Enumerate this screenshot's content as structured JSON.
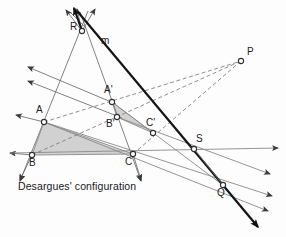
{
  "figure": {
    "title_caption": "Desargues' configuration",
    "caption_position": {
      "x": 18,
      "y": 186
    },
    "width": 286,
    "height": 237,
    "background_color": "#fdfdfd"
  },
  "colors": {
    "line_solid": "#5a5a5a",
    "line_dashed": "#6e6e6e",
    "line_heavy": "#1a1a1a",
    "triangle_fill": "#cfcfcf",
    "node_stroke": "#3a3a3a",
    "node_fill": "#ffffff",
    "text": "#1a1a1a"
  },
  "points": [
    {
      "name": "R",
      "x": 82,
      "y": 31,
      "label": "R",
      "label_x": 70,
      "label_y": 27
    },
    {
      "name": "P",
      "x": 241,
      "y": 61,
      "label": "P",
      "label_x": 247,
      "label_y": 52
    },
    {
      "name": "A",
      "x": 44,
      "y": 122,
      "label": "A",
      "label_x": 37,
      "label_y": 110
    },
    {
      "name": "B",
      "x": 32,
      "y": 155,
      "label": "B",
      "label_x": 30,
      "label_y": 160
    },
    {
      "name": "C",
      "x": 133,
      "y": 154,
      "label": "C",
      "label_x": 126,
      "label_y": 159
    },
    {
      "name": "A'",
      "x": 112,
      "y": 102,
      "label": "A'",
      "label_x": 106,
      "label_y": 90
    },
    {
      "name": "B'",
      "x": 117,
      "y": 117,
      "label": "B'",
      "label_x": 108,
      "label_y": 122
    },
    {
      "name": "C'",
      "x": 153,
      "y": 133,
      "label": "C'",
      "label_x": 148,
      "label_y": 122
    },
    {
      "name": "S",
      "x": 194,
      "y": 149,
      "label": "S",
      "label_x": 196,
      "label_y": 138
    },
    {
      "name": "Q",
      "x": 223,
      "y": 185,
      "label": "Q",
      "label_x": 218,
      "label_y": 190
    }
  ],
  "line_label": {
    "text": "m",
    "x": 102,
    "y": 37
  },
  "triangles": [
    {
      "name": "outer-triangle-ABC",
      "vertices": [
        "A",
        "B",
        "C"
      ],
      "fill": "#cfcfcf"
    },
    {
      "name": "inner-triangle-A'B'C'",
      "vertices": [
        "A'",
        "B'",
        "C'"
      ],
      "fill": "#cfcfcf"
    }
  ],
  "lines": {
    "perspective_rays_from_R": [
      {
        "name": "ray-R-A-B",
        "through": [
          "R",
          "A",
          "B"
        ]
      },
      {
        "name": "ray-R-A'-B'",
        "through": [
          "R",
          "A'",
          "B'"
        ]
      },
      {
        "name": "ray-R-C-C'",
        "through": [
          "R",
          "C'",
          "C"
        ]
      }
    ],
    "axis_line_m": {
      "name": "line-m",
      "through": [
        "R",
        "S",
        "Q"
      ],
      "style": "heavy-solid",
      "label": "m"
    },
    "dashed_to_P": [
      {
        "name": "dashed-A-A'-P",
        "through": [
          "A",
          "A'",
          "P"
        ]
      },
      {
        "name": "dashed-B-B'-P",
        "through": [
          "B",
          "B'",
          "P"
        ]
      },
      {
        "name": "dashed-C-C'-P",
        "through": [
          "C",
          "C'",
          "P"
        ]
      }
    ],
    "side_extensions": [
      {
        "name": "line-B-C-S",
        "through": [
          "B",
          "C",
          "S"
        ]
      },
      {
        "name": "line-A-C-Q",
        "through": [
          "A",
          "C",
          "Q"
        ]
      },
      {
        "name": "line-A-B-Q",
        "through": [
          "A",
          "B",
          "Q"
        ]
      },
      {
        "name": "line-B'-C'-S",
        "through": [
          "B'",
          "C'",
          "S"
        ]
      },
      {
        "name": "line-A'-C'-Q",
        "through": [
          "A'",
          "C'",
          "Q"
        ]
      }
    ]
  },
  "arrowheads": [
    {
      "name": "arrow-top-left-1",
      "x": 62,
      "y": 7,
      "angle": -118
    },
    {
      "name": "arrow-top-left-2",
      "x": 74,
      "y": 5,
      "angle": -100
    },
    {
      "name": "arrow-top-right-1",
      "x": 93,
      "y": 6,
      "angle": -64
    },
    {
      "name": "arrow-left-upper",
      "x": 26,
      "y": 66,
      "angle": 200
    },
    {
      "name": "arrow-left-mid",
      "x": 26,
      "y": 80,
      "angle": 197
    },
    {
      "name": "arrow-left-A",
      "x": 14,
      "y": 114,
      "angle": 200
    },
    {
      "name": "arrow-left-B",
      "x": 8,
      "y": 152,
      "angle": 180
    },
    {
      "name": "arrow-down-left-B",
      "x": 20,
      "y": 180,
      "angle": 110
    },
    {
      "name": "arrow-down-C",
      "x": 140,
      "y": 180,
      "angle": 78
    },
    {
      "name": "arrow-right-axis",
      "x": 278,
      "y": 148,
      "angle": 0
    },
    {
      "name": "arrow-lower-right-1",
      "x": 271,
      "y": 174,
      "angle": 33
    },
    {
      "name": "arrow-lower-right-2",
      "x": 273,
      "y": 196,
      "angle": 28
    },
    {
      "name": "arrow-lower-right-3",
      "x": 265,
      "y": 212,
      "angle": 36
    },
    {
      "name": "arrow-line-m-end",
      "x": 257,
      "y": 226,
      "angle": 56
    }
  ]
}
